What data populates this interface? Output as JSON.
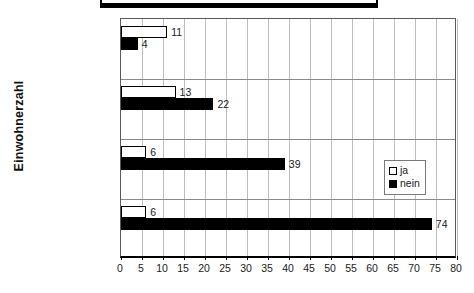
{
  "chart_data": {
    "type": "bar",
    "orientation": "horizontal",
    "title": "",
    "xlabel": "",
    "ylabel": "Einwohnerzahl",
    "xlim": [
      0,
      80
    ],
    "xticks": [
      0,
      5,
      10,
      15,
      20,
      25,
      30,
      35,
      40,
      45,
      50,
      55,
      60,
      65,
      70,
      75,
      80
    ],
    "grid": true,
    "legend_position": "right",
    "categories": [
      "250.000 und mehr",
      "100.000-250.000",
      "50.000-100.000",
      "30.000-50.000"
    ],
    "series": [
      {
        "name": "ja",
        "values": [
          11,
          13,
          6,
          6
        ]
      },
      {
        "name": "nein",
        "values": [
          4,
          22,
          39,
          74
        ]
      }
    ]
  },
  "legend": {
    "items": [
      {
        "label": "ja",
        "swatch": "open-square-icon"
      },
      {
        "label": "nein",
        "swatch": "filled-square-icon"
      }
    ]
  },
  "axes": {
    "y_title": "Einwohnerzahl"
  }
}
